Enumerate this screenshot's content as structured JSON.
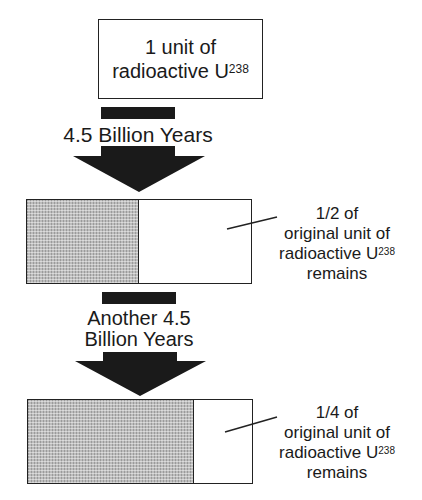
{
  "diagram": {
    "title_box": {
      "line1": "1 unit of",
      "line2": "radioactive U",
      "superscript": "238"
    },
    "step1": {
      "arrow_label": "4.5 Billion Years",
      "result": {
        "fraction_remaining": 0.5,
        "callout_line1": "1/2 of",
        "callout_line2": "original unit of",
        "callout_line3": "radioactive U",
        "callout_superscript": "238",
        "callout_line4": "remains"
      }
    },
    "step2": {
      "arrow_label_line1": "Another 4.5",
      "arrow_label_line2": "Billion Years",
      "result": {
        "fraction_remaining": 0.25,
        "callout_line1": "1/4 of",
        "callout_line2": "original unit of",
        "callout_line3": "radioactive U",
        "callout_superscript": "238",
        "callout_line4": "remains"
      }
    },
    "colors": {
      "ink": "#1a1a1a",
      "stipple_fill": "#bdbdbd",
      "background": "#ffffff"
    }
  }
}
